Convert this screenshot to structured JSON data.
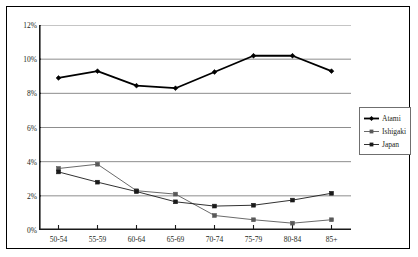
{
  "chart_data": {
    "type": "line",
    "title": "",
    "xlabel": "",
    "ylabel": "",
    "categories": [
      "50-54",
      "55-59",
      "60-64",
      "65-69",
      "70-74",
      "75-79",
      "80-84",
      "85+"
    ],
    "ylim": [
      0,
      12
    ],
    "ytick_values": [
      0,
      2,
      4,
      6,
      8,
      10,
      12
    ],
    "ytick_labels": [
      "0%",
      "2%",
      "4%",
      "6%",
      "8%",
      "10%",
      "12%"
    ],
    "grid": true,
    "legend_position": "right",
    "series": [
      {
        "name": "Atami",
        "color": "#000000",
        "marker": "diamond",
        "line_width": 1.8,
        "values": [
          8.9,
          9.3,
          8.45,
          8.3,
          9.25,
          10.2,
          10.2,
          9.3
        ]
      },
      {
        "name": "Ishigaki",
        "color": "#595959",
        "marker": "square",
        "line_width": 0.9,
        "values": [
          3.6,
          3.85,
          2.3,
          2.1,
          0.85,
          0.6,
          0.4,
          0.6
        ]
      },
      {
        "name": "Japan",
        "color": "#1a1a1a",
        "marker": "square",
        "line_width": 0.9,
        "values": [
          3.4,
          2.8,
          2.25,
          1.65,
          1.4,
          1.45,
          1.75,
          2.15
        ]
      }
    ]
  },
  "axis": {
    "ytick_labels": [
      "12%",
      "10%",
      "8%",
      "6%",
      "4%",
      "2%",
      "0%"
    ]
  },
  "legend": {
    "items": [
      {
        "label": "Atami"
      },
      {
        "label": "Ishigaki"
      },
      {
        "label": "Japan"
      }
    ]
  }
}
